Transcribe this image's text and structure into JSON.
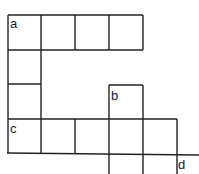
{
  "diagram": {
    "labels": {
      "a": "a",
      "b": "b",
      "c": "c",
      "d": "d"
    },
    "line_color": "#222222",
    "background": "#ffffff"
  }
}
